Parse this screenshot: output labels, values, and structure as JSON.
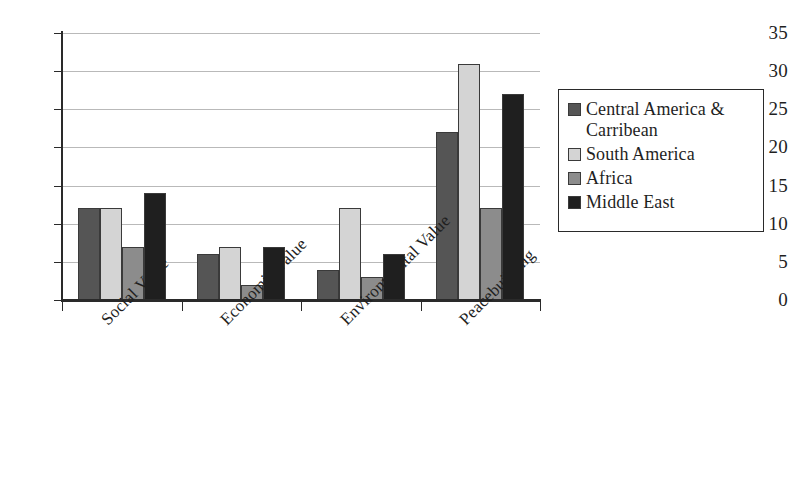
{
  "chart_data": {
    "type": "bar",
    "title": "",
    "subtitle": "",
    "xlabel": "",
    "ylabel": "",
    "ylim": [
      0,
      35
    ],
    "yticks": [
      0,
      5,
      10,
      15,
      20,
      25,
      30,
      35
    ],
    "ytick_labels": [
      "0",
      "5",
      "10",
      "15",
      "20",
      "25",
      "30",
      "35"
    ],
    "grid": true,
    "legend_position": "right",
    "categories": [
      "Social Value",
      "Economic Value",
      "Environmental Value",
      "Peacebuilding"
    ],
    "series": [
      {
        "name": "Central America & Carribean",
        "color": "#555555",
        "values": [
          12,
          6,
          4,
          22
        ]
      },
      {
        "name": "South America",
        "color": "#d4d4d4",
        "values": [
          12,
          7,
          12,
          31
        ]
      },
      {
        "name": "Africa",
        "color": "#8c8c8c",
        "values": [
          7,
          2,
          3,
          12
        ]
      },
      {
        "name": "Middle East",
        "color": "#1f1f1f",
        "values": [
          14,
          7,
          6,
          27
        ]
      }
    ]
  },
  "legend": {
    "entries": [
      {
        "label": "Central America & Carribean",
        "swatch_color": "#555555"
      },
      {
        "label": "South America",
        "swatch_color": "#d4d4d4"
      },
      {
        "label": "Africa",
        "swatch_color": "#8c8c8c"
      },
      {
        "label": "Middle East",
        "swatch_color": "#1f1f1f"
      }
    ]
  },
  "axes": {
    "y_tick_labels": [
      "35",
      "30",
      "25",
      "20",
      "15",
      "10",
      "5",
      "0"
    ],
    "x_tick_labels": [
      "Social Value",
      "Economic Value",
      "Environmental Value",
      "Peacebuilding"
    ]
  },
  "colors": {
    "axis": "#2a2a2a",
    "gridline": "#b9b9b9",
    "background": "#ffffff",
    "text": "#1f1f1f"
  }
}
